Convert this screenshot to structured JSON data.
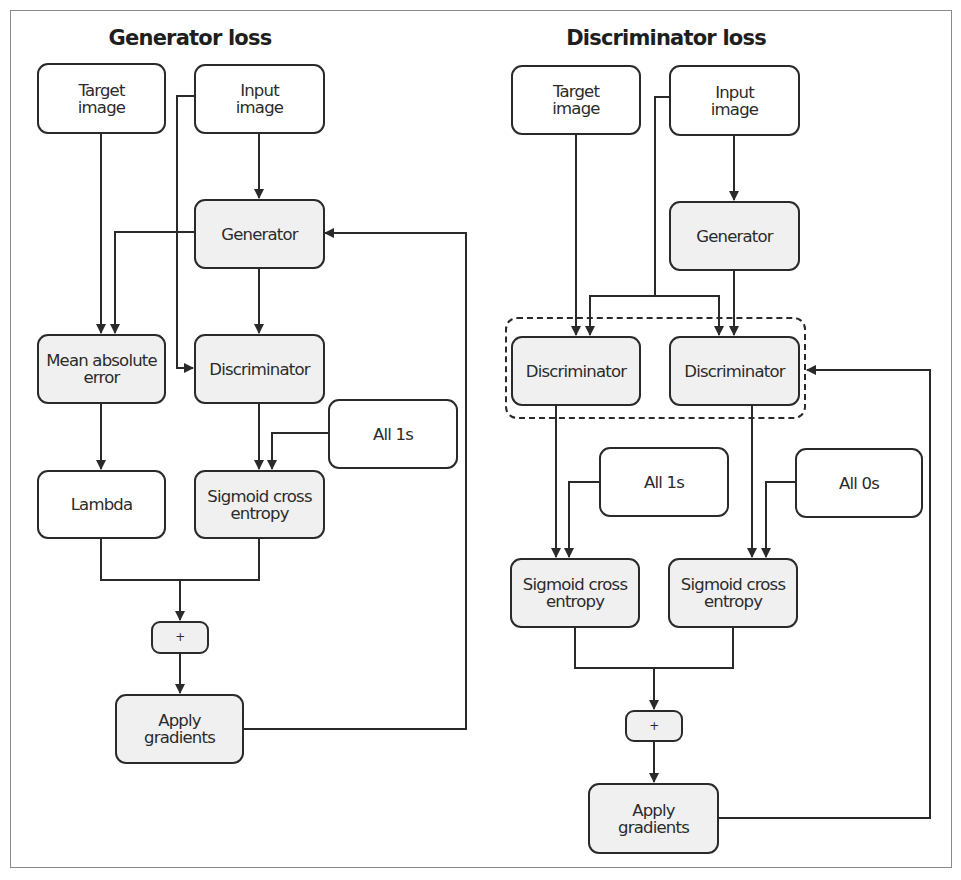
{
  "diagram": {
    "generator_panel": {
      "title": "Generator loss",
      "nodes": {
        "target_image": "Target\nimage",
        "input_image": "Input\nimage",
        "generator": "Generator",
        "mean_absolute_error": "Mean absolute\nerror",
        "discriminator": "Discriminator",
        "all_1s": "All 1s",
        "lambda": "Lambda",
        "sigmoid_cross_entropy": "Sigmoid cross\nentropy",
        "plus": "+",
        "apply_gradients": "Apply\ngradients"
      }
    },
    "discriminator_panel": {
      "title": "Discriminator loss",
      "nodes": {
        "target_image": "Target\nimage",
        "input_image": "Input\nimage",
        "generator": "Generator",
        "discriminator_real": "Discriminator",
        "discriminator_fake": "Discriminator",
        "all_1s": "All 1s",
        "all_0s": "All 0s",
        "sigmoid_cross_entropy_real": "Sigmoid cross\nentropy",
        "sigmoid_cross_entropy_fake": "Sigmoid cross\nentropy",
        "plus": "+",
        "apply_gradients": "Apply\ngradients"
      }
    },
    "edges": [
      {
        "from": "G.input_image",
        "to": "G.generator"
      },
      {
        "from": "G.target_image",
        "to": "G.mean_absolute_error"
      },
      {
        "from": "G.generator",
        "to": "G.mean_absolute_error"
      },
      {
        "from": "G.input_image",
        "to": "G.discriminator"
      },
      {
        "from": "G.generator",
        "to": "G.discriminator"
      },
      {
        "from": "G.mean_absolute_error",
        "to": "G.lambda"
      },
      {
        "from": "G.discriminator",
        "to": "G.sigmoid_cross_entropy"
      },
      {
        "from": "G.all_1s",
        "to": "G.sigmoid_cross_entropy"
      },
      {
        "from": "G.lambda",
        "to": "G.plus"
      },
      {
        "from": "G.sigmoid_cross_entropy",
        "to": "G.plus"
      },
      {
        "from": "G.plus",
        "to": "G.apply_gradients"
      },
      {
        "from": "G.apply_gradients",
        "to": "G.generator"
      },
      {
        "from": "D.input_image",
        "to": "D.generator"
      },
      {
        "from": "D.target_image",
        "to": "D.discriminator_real"
      },
      {
        "from": "D.input_image",
        "to": "D.discriminator_real"
      },
      {
        "from": "D.input_image",
        "to": "D.discriminator_fake"
      },
      {
        "from": "D.generator",
        "to": "D.discriminator_fake"
      },
      {
        "from": "D.discriminator_real",
        "to": "D.sigmoid_cross_entropy_real"
      },
      {
        "from": "D.all_1s",
        "to": "D.sigmoid_cross_entropy_real"
      },
      {
        "from": "D.discriminator_fake",
        "to": "D.sigmoid_cross_entropy_fake"
      },
      {
        "from": "D.all_0s",
        "to": "D.sigmoid_cross_entropy_fake"
      },
      {
        "from": "D.sigmoid_cross_entropy_real",
        "to": "D.plus"
      },
      {
        "from": "D.sigmoid_cross_entropy_fake",
        "to": "D.plus"
      },
      {
        "from": "D.plus",
        "to": "D.apply_gradients"
      },
      {
        "from": "D.apply_gradients",
        "to": "D.discriminator_group"
      }
    ],
    "colors": {
      "stroke": "#2a2a2a",
      "model_fill": "#f0f0f0",
      "data_fill": "#ffffff",
      "frame": "#8a8a8a"
    }
  }
}
